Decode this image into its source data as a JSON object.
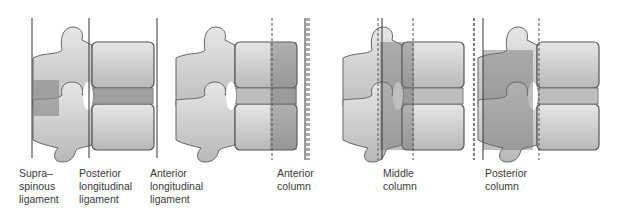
{
  "figure": {
    "panels": [
      {
        "name": "ligaments",
        "labels": [
          {
            "text": "Supra–\nspinous\nligament",
            "x": 19,
            "y": 167
          },
          {
            "text": "Posterior\nlongitudinal\nligament",
            "x": 79,
            "y": 167
          },
          {
            "text": "Anterior\nlongitudinal\nligament",
            "x": 150,
            "y": 167
          }
        ]
      },
      {
        "name": "anterior-column",
        "labels": [
          {
            "text": "Anterior\ncolumn",
            "x": 277,
            "y": 167
          }
        ]
      },
      {
        "name": "middle-column",
        "labels": [
          {
            "text": "Middle\ncolumn",
            "x": 383,
            "y": 167
          }
        ]
      },
      {
        "name": "posterior-column",
        "labels": [
          {
            "text": "Posterior\ncolumn",
            "x": 485,
            "y": 167
          }
        ]
      }
    ],
    "colors": {
      "bone_light": "#d9d9d9",
      "bone_mid": "#b3b3b3",
      "bone_dark": "#8a8a8a",
      "outline": "#555555",
      "line": "#333333"
    }
  }
}
